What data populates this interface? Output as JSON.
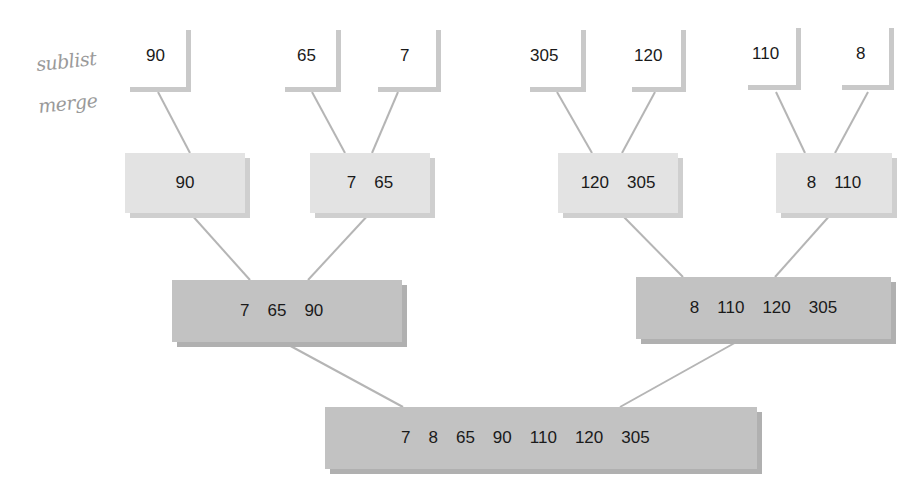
{
  "annotations": {
    "top_note": "sublist",
    "bottom_note": "merge"
  },
  "leaves": [
    {
      "value": "90"
    },
    {
      "value": "65"
    },
    {
      "value": "7"
    },
    {
      "value": "305"
    },
    {
      "value": "120"
    },
    {
      "value": "110"
    },
    {
      "value": "8"
    }
  ],
  "level1": [
    {
      "values": [
        "90"
      ]
    },
    {
      "values": [
        "7",
        "65"
      ]
    },
    {
      "values": [
        "120",
        "305"
      ]
    },
    {
      "values": [
        "8",
        "110"
      ]
    }
  ],
  "level2": [
    {
      "values": [
        "7",
        "65",
        "90"
      ]
    },
    {
      "values": [
        "8",
        "110",
        "120",
        "305"
      ]
    }
  ],
  "level3": {
    "values": [
      "7",
      "8",
      "65",
      "90",
      "110",
      "120",
      "305"
    ]
  },
  "colors": {
    "leaf_border": "#c9c9c9",
    "level1_fill": "#e3e3e3",
    "level2_fill": "#c2c2c2",
    "connector": "#b5b5b5"
  }
}
